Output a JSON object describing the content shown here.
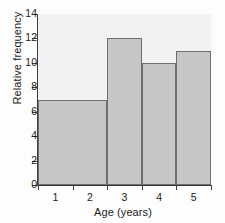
{
  "chart_data": {
    "type": "bar",
    "title": "",
    "xlabel": "Age (years)",
    "ylabel": "Relative frequency",
    "categories": [
      "1",
      "2",
      "3",
      "4",
      "5"
    ],
    "values": [
      7,
      7,
      12,
      10,
      11
    ],
    "bars": [
      {
        "label": "1-2",
        "span_categories": [
          "1",
          "2"
        ],
        "value": 7
      },
      {
        "label": "3",
        "span_categories": [
          "3"
        ],
        "value": 12
      },
      {
        "label": "4",
        "span_categories": [
          "4"
        ],
        "value": 10
      },
      {
        "label": "5",
        "span_categories": [
          "5"
        ],
        "value": 11
      }
    ],
    "xtick_labels": [
      "1",
      "2",
      "3",
      "4",
      "5"
    ],
    "ytick_labels": [
      "0",
      "2",
      "4",
      "6",
      "8",
      "10",
      "12",
      "14"
    ],
    "ytick_values": [
      0,
      2,
      4,
      6,
      8,
      10,
      12,
      14
    ],
    "ylim": [
      0,
      14
    ],
    "grid": false,
    "legend": "none",
    "colors": {
      "bar_fill": "#c6c6c6",
      "bar_border": "#6e6e6e",
      "plot_background": "#f2f2f2",
      "axis": "#3b3b3b",
      "text": "#1c1c1c",
      "figure_background": "#fdfdfd"
    }
  }
}
